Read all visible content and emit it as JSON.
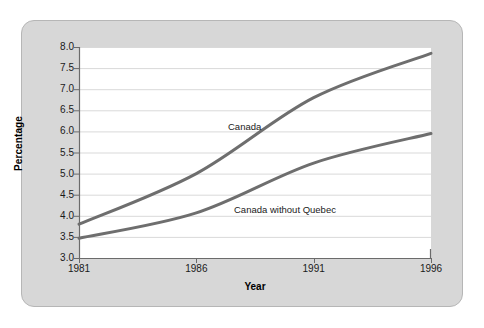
{
  "chart_data": {
    "type": "line",
    "title": "",
    "xlabel": "Year",
    "ylabel": "Percentage",
    "x": [
      1981,
      1986,
      1991,
      1996
    ],
    "xticklabels": [
      "1981",
      "1986",
      "1991",
      "1996"
    ],
    "xlim": [
      1981,
      1996
    ],
    "ylim": [
      3.0,
      8.0
    ],
    "yticks": [
      3.0,
      3.5,
      4.0,
      4.5,
      5.0,
      5.5,
      6.0,
      6.5,
      7.0,
      7.5,
      8.0
    ],
    "yticklabels": [
      "3.0",
      "3.5",
      "4.0",
      "4.5",
      "5.0",
      "5.5",
      "6.0",
      "6.5",
      "7.0",
      "7.5",
      "8.0"
    ],
    "grid": true,
    "legend_position": "inline-annotations",
    "series": [
      {
        "name": "Canada",
        "values": [
          3.8,
          5.0,
          6.8,
          7.85
        ],
        "color": "#6e6e6e"
      },
      {
        "name": "Canada without Quebec",
        "values": [
          3.47,
          4.07,
          5.25,
          5.95
        ],
        "color": "#6e6e6e"
      }
    ],
    "annotations": [
      {
        "text": "Canada",
        "x": 1989.3,
        "y": 6.15
      },
      {
        "text": "Canada without Quebec",
        "x": 1989.6,
        "y": 4.2
      }
    ]
  },
  "style": {
    "panel_color": "#d7d7d7",
    "panel_border_color": "#b6b6b6",
    "plot_background": "#ffffff",
    "line_color": "#6e6e6e",
    "gridline_color": "#d9d9d9",
    "axis_color": "#6b6b6b",
    "text_color": "#1a1a1a"
  }
}
